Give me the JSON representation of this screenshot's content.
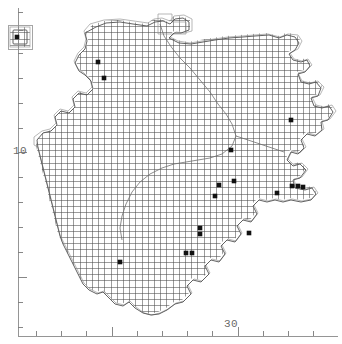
{
  "figure": {
    "width": 342,
    "height": 344,
    "background": "#ffffff"
  },
  "axes": {
    "line_color": "#8a8a8a",
    "tick_color": "#7a7a7a",
    "y_axis": {
      "label": "10",
      "label_x": 13,
      "label_y": 145,
      "orientation": "left",
      "axis_x": 18,
      "axis_top": 8,
      "axis_bottom": 336,
      "ticks": [
        12,
        30,
        53,
        78,
        103,
        128,
        152,
        177,
        202,
        227,
        252,
        277,
        302,
        327
      ],
      "major_ticks": [
        152,
        277
      ],
      "tick_minor_len": 5,
      "tick_major_len": 9
    },
    "x_axis": {
      "label": "30",
      "label_x": 224,
      "label_y": 318,
      "orientation": "bottom",
      "axis_y": 336,
      "axis_left": 18,
      "axis_right": 338,
      "ticks": [
        36,
        61,
        86,
        112,
        137,
        162,
        187,
        212,
        238,
        263,
        288,
        313
      ],
      "major_ticks": [
        112,
        238
      ],
      "tick_minor_len": 5,
      "tick_major_len": 9
    }
  },
  "map": {
    "grid": {
      "cell_size": 6.2,
      "line_color": "#4a4a4a",
      "line_width": 0.55,
      "description": "10km square lattice clipped to landmass"
    },
    "coastline": {
      "color": "#5a5a5a",
      "width": 0.9
    },
    "internal_boundary": {
      "color": "#707070",
      "width": 0.8,
      "description": "inland river / county boundary line"
    },
    "hatch_outline": {
      "color": "#9a9a9a",
      "width": 0.7,
      "description": "stepped outline of occupied grid squares"
    }
  },
  "inset": {
    "name": "offshore-island-inset",
    "x": 8,
    "y": 25,
    "width": 24,
    "height": 24,
    "border_color": "#8f8f8f"
  },
  "records": {
    "marker": {
      "shape": "filled-square",
      "color": "#111111",
      "size": 4.6
    },
    "points": [
      {
        "x": 17,
        "y": 37,
        "name": "record-inset-island"
      },
      {
        "x": 98,
        "y": 62,
        "name": "record-nw-coast-1"
      },
      {
        "x": 104,
        "y": 78,
        "name": "record-nw-coast-2"
      },
      {
        "x": 231,
        "y": 150,
        "name": "record-central-east"
      },
      {
        "x": 219,
        "y": 185,
        "name": "record-midland-1"
      },
      {
        "x": 234,
        "y": 181,
        "name": "record-midland-2"
      },
      {
        "x": 215,
        "y": 196,
        "name": "record-midland-3"
      },
      {
        "x": 277,
        "y": 193,
        "name": "record-east-coast-1"
      },
      {
        "x": 292,
        "y": 186,
        "name": "record-east-coast-2"
      },
      {
        "x": 298,
        "y": 186,
        "name": "record-east-coast-3"
      },
      {
        "x": 303,
        "y": 187,
        "name": "record-east-coast-4"
      },
      {
        "x": 200,
        "y": 228,
        "name": "record-south-1"
      },
      {
        "x": 200,
        "y": 234,
        "name": "record-south-2"
      },
      {
        "x": 249,
        "y": 233,
        "name": "record-southeast-1"
      },
      {
        "x": 186,
        "y": 253,
        "name": "record-south-3"
      },
      {
        "x": 192,
        "y": 253,
        "name": "record-south-4"
      },
      {
        "x": 120,
        "y": 262,
        "name": "record-southwest-1"
      },
      {
        "x": 291,
        "y": 120,
        "name": "record-ne-coast-1"
      }
    ],
    "count": 18
  }
}
